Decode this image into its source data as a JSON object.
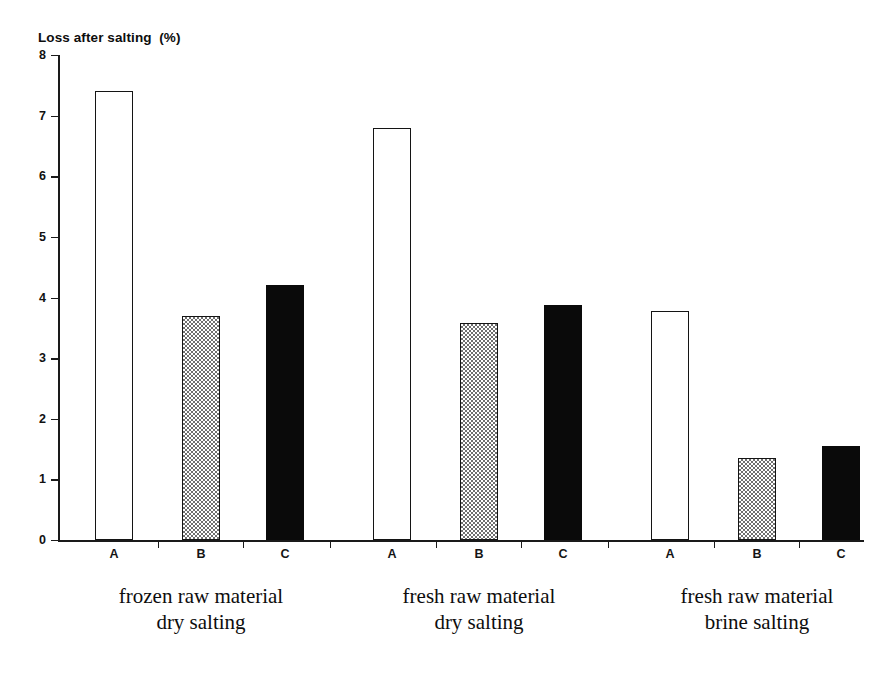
{
  "chart_data": {
    "type": "bar",
    "title": "Loss after salting  (%)",
    "xlabel": "",
    "ylabel": "Loss after salting (%)",
    "ylim": [
      0,
      8
    ],
    "ytick_labels": [
      "8",
      "7",
      "6",
      "5",
      "4",
      "3",
      "2",
      "1",
      "0"
    ],
    "ytick_values": [
      8,
      7,
      6,
      5,
      4,
      3,
      2,
      1,
      0
    ],
    "grid": false,
    "legend": "none",
    "categories": [
      "A",
      "B",
      "C"
    ],
    "groups": [
      {
        "caption_line1": "frozen raw material",
        "caption_line2": "dry salting",
        "bars": [
          {
            "label": "A",
            "value": 7.4,
            "style": "white"
          },
          {
            "label": "B",
            "value": 3.7,
            "style": "gray"
          },
          {
            "label": "C",
            "value": 4.2,
            "style": "black"
          }
        ]
      },
      {
        "caption_line1": "fresh raw material",
        "caption_line2": "dry salting",
        "bars": [
          {
            "label": "A",
            "value": 6.8,
            "style": "white"
          },
          {
            "label": "B",
            "value": 3.58,
            "style": "gray"
          },
          {
            "label": "C",
            "value": 3.88,
            "style": "black"
          }
        ]
      },
      {
        "caption_line1": "fresh raw material",
        "caption_line2": "brine salting",
        "bars": [
          {
            "label": "A",
            "value": 3.77,
            "style": "white"
          },
          {
            "label": "B",
            "value": 1.35,
            "style": "gray"
          },
          {
            "label": "C",
            "value": 1.55,
            "style": "black"
          }
        ]
      }
    ],
    "series": [
      {
        "name": "A",
        "values": [
          7.4,
          6.8,
          3.77
        ]
      },
      {
        "name": "B",
        "values": [
          3.7,
          3.58,
          1.35
        ]
      },
      {
        "name": "C",
        "values": [
          4.2,
          3.88,
          1.55
        ]
      }
    ],
    "colors": {
      "A": "#ffffff",
      "B": "#808080",
      "C": "#0a0a0a",
      "axis": "#1a1a1a",
      "text": "#111111",
      "background": "#ffffff"
    }
  }
}
